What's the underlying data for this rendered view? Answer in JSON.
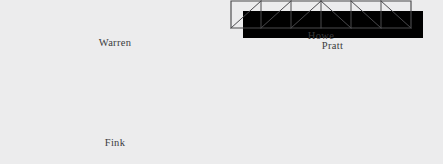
{
  "figure": {
    "background_color": "#ececed",
    "line_color": "#4a4a4d",
    "label_color": "#3b3b3d",
    "width": 443,
    "height": 164
  },
  "trusses": [
    {
      "id": "warren",
      "label": "Warren",
      "description": "Trapezoidal parallel-chord truss with alternating zigzag diagonals forming equilateral triangles; no vertical members.",
      "panels": 7,
      "span": 196,
      "depth": 24,
      "top_chord_inset": 12,
      "geometry": {
        "bottom_chord": [
          [
            0,
            24
          ],
          [
            196,
            24
          ]
        ],
        "top_chord": [
          [
            12,
            0
          ],
          [
            184,
            0
          ]
        ],
        "diagonals": [
          [
            [
              0,
              24
            ],
            [
              12,
              0
            ]
          ],
          [
            [
              12,
              0
            ],
            [
              24.57,
              24
            ]
          ],
          [
            [
              24.57,
              24
            ],
            [
              36.57,
              0
            ]
          ],
          [
            [
              36.57,
              0
            ],
            [
              49.14,
              24
            ]
          ],
          [
            [
              49.14,
              24
            ],
            [
              61.14,
              0
            ]
          ],
          [
            [
              61.14,
              0
            ],
            [
              73.71,
              24
            ]
          ],
          [
            [
              73.71,
              24
            ],
            [
              85.71,
              0
            ]
          ],
          [
            [
              85.71,
              0
            ],
            [
              98.28,
              24
            ]
          ],
          [
            [
              98.28,
              24
            ],
            [
              110.28,
              0
            ]
          ],
          [
            [
              110.28,
              0
            ],
            [
              122.86,
              24
            ]
          ],
          [
            [
              122.86,
              24
            ],
            [
              134.86,
              0
            ]
          ],
          [
            [
              134.86,
              0
            ],
            [
              147.43,
              24
            ]
          ],
          [
            [
              147.43,
              24
            ],
            [
              159.43,
              0
            ]
          ],
          [
            [
              159.43,
              0
            ],
            [
              172,
              24
            ]
          ],
          [
            [
              172,
              24
            ],
            [
              184,
              0
            ]
          ],
          [
            [
              184,
              0
            ],
            [
              196,
              24
            ]
          ]
        ]
      }
    },
    {
      "id": "pratt",
      "label": "Pratt",
      "description": "Rectangular parallel-chord truss with verticals and diagonals sloping down toward the centre (V pattern).",
      "panels": 6,
      "span": 180,
      "depth": 27,
      "geometry": {
        "outline": [
          [
            0,
            0
          ],
          [
            180,
            0
          ],
          [
            180,
            27
          ],
          [
            0,
            27
          ]
        ],
        "verticals": [
          30,
          60,
          90,
          120,
          150
        ],
        "diagonals": [
          [
            [
              0,
              0
            ],
            [
              30,
              27
            ]
          ],
          [
            [
              30,
              0
            ],
            [
              60,
              27
            ]
          ],
          [
            [
              60,
              0
            ],
            [
              90,
              27
            ]
          ],
          [
            [
              90,
              27
            ],
            [
              120,
              0
            ]
          ],
          [
            [
              120,
              27
            ],
            [
              150,
              0
            ]
          ],
          [
            [
              150,
              27
            ],
            [
              180,
              0
            ]
          ]
        ]
      }
    },
    {
      "id": "fink",
      "label": "Fink",
      "description": "Triangular roof truss with a central apex and symmetric W-shaped web bracing.",
      "span": 212,
      "rise": 44,
      "geometry": {
        "bottom_chord": [
          [
            0,
            44
          ],
          [
            212,
            44
          ]
        ],
        "rafters": [
          [
            [
              0,
              44
            ],
            [
              106,
              0
            ]
          ],
          [
            [
              106,
              0
            ],
            [
              212,
              44
            ]
          ]
        ],
        "web": [
          [
            [
              53,
              22
            ],
            [
              70.7,
              44
            ]
          ],
          [
            [
              70.7,
              44
            ],
            [
              106,
              0
            ]
          ],
          [
            [
              106,
              0
            ],
            [
              141.3,
              44
            ]
          ],
          [
            [
              141.3,
              44
            ],
            [
              159,
              22
            ]
          ]
        ]
      }
    },
    {
      "id": "howe",
      "label": "Howe",
      "description": "Rectangular parallel-chord truss with verticals and diagonals sloping up toward the centre (inverted-V pattern), the mirror of the Pratt.",
      "panels": 6,
      "span": 180,
      "depth": 27,
      "geometry": {
        "outline": [
          [
            0,
            0
          ],
          [
            180,
            0
          ],
          [
            180,
            27
          ],
          [
            0,
            27
          ]
        ],
        "verticals": [
          30,
          60,
          90,
          120,
          150
        ],
        "diagonals": [
          [
            [
              0,
              27
            ],
            [
              30,
              0
            ]
          ],
          [
            [
              30,
              27
            ],
            [
              60,
              0
            ]
          ],
          [
            [
              60,
              27
            ],
            [
              90,
              0
            ]
          ],
          [
            [
              90,
              0
            ],
            [
              120,
              27
            ]
          ],
          [
            [
              120,
              0
            ],
            [
              150,
              27
            ]
          ],
          [
            [
              150,
              0
            ],
            [
              180,
              27
            ]
          ]
        ]
      }
    }
  ]
}
